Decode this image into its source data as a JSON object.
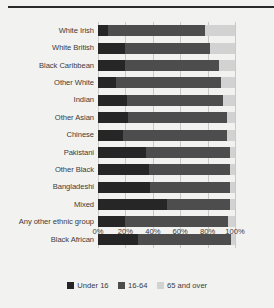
{
  "chart_data": {
    "type": "bar",
    "orientation": "horizontal",
    "stacked": true,
    "stack_total": 100,
    "title": "",
    "subtitle": "",
    "xlabel": "",
    "ylabel": "",
    "xlim": [
      0,
      100
    ],
    "xtick_labels": [
      "0%",
      "20%",
      "40%",
      "60%",
      "80%",
      "100%"
    ],
    "xtick_values": [
      0,
      20,
      40,
      60,
      80,
      100
    ],
    "grid": true,
    "legend_position": "bottom",
    "categories": [
      "White Irish",
      "White British",
      "Black Caribbean",
      "Other White",
      "Indian",
      "Other Asian",
      "Chinese",
      "Pakistani",
      "Other Black",
      "Bangladeshi",
      "Mixed",
      "Any other ethnic group",
      "Black African"
    ],
    "series": [
      {
        "name": "Under 16",
        "color": "#262626",
        "values": [
          7,
          20,
          20,
          13,
          21,
          22,
          18,
          35,
          37,
          38,
          50,
          20,
          29
        ]
      },
      {
        "name": "16-64",
        "color": "#4d4d4d",
        "values": [
          71,
          62,
          68,
          77,
          70,
          72,
          76,
          61,
          59,
          58,
          46,
          75,
          68
        ]
      },
      {
        "name": "65 and over",
        "color": "#d2d2d2",
        "values": [
          22,
          18,
          12,
          10,
          9,
          6,
          6,
          4,
          4,
          4,
          4,
          5,
          3
        ]
      }
    ],
    "legend": [
      {
        "label": "Under 16",
        "color": "#262626"
      },
      {
        "label": "16-64",
        "color": "#4d4d4d"
      },
      {
        "label": "65 and over",
        "color": "#d2d2d2"
      }
    ]
  }
}
